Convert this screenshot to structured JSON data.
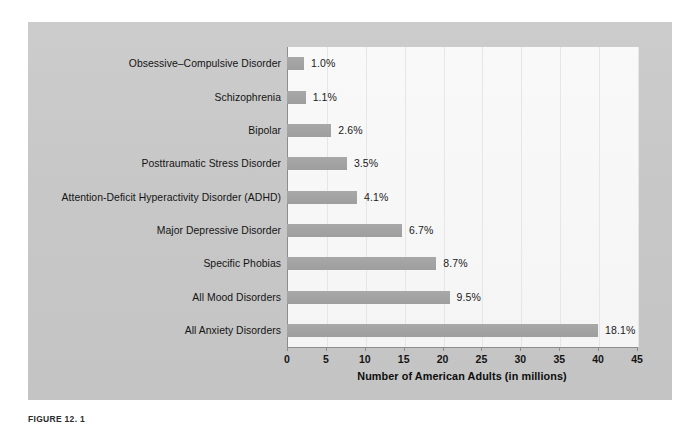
{
  "figure": {
    "caption": "FIGURE 12. 1",
    "panel_color": "#c9c9c9",
    "plot_bg_color": "#f7f7f7",
    "bar_color": "#a3a3a3",
    "axis_color": "#8d8d8d"
  },
  "chart_data": {
    "type": "bar",
    "orientation": "horizontal",
    "title": "",
    "xlabel": "Number of American Adults (in millions)",
    "ylabel": "",
    "xlim": [
      0,
      45
    ],
    "xticks": [
      0,
      5,
      10,
      15,
      20,
      25,
      30,
      35,
      40,
      45
    ],
    "xticklabels": [
      "0",
      "5",
      "10",
      "15",
      "20",
      "25",
      "30",
      "35",
      "40",
      "45"
    ],
    "grid": true,
    "legend": false,
    "categories": [
      "Obsessive–Compulsive Disorder",
      "Schizophrenia",
      "Bipolar",
      "Posttraumatic Stress Disorder",
      "Attention-Deficit Hyperactivity Disorder (ADHD)",
      "Major Depressive Disorder",
      "Specific Phobias",
      "All Mood Disorders",
      "All Anxiety Disorders"
    ],
    "values": [
      2.2,
      2.4,
      5.7,
      7.7,
      9.0,
      14.8,
      19.2,
      20.9,
      40.0
    ],
    "value_unit": "millions of American adults",
    "data_labels": [
      "1.0%",
      "1.1%",
      "2.6%",
      "3.5%",
      "4.1%",
      "6.7%",
      "8.7%",
      "9.5%",
      "18.1%"
    ],
    "percentages": [
      1.0,
      1.1,
      2.6,
      3.5,
      4.1,
      6.7,
      8.7,
      9.5,
      18.1
    ]
  }
}
